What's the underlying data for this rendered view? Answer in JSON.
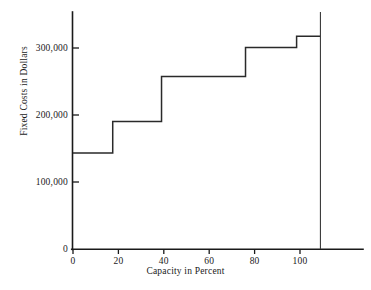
{
  "chart_data": {
    "type": "line",
    "subtype": "step",
    "title": "",
    "xlabel": "Capacity in Percent",
    "ylabel": "Fixed Costs in Dollars",
    "xlim": [
      0,
      115
    ],
    "ylim": [
      0,
      355000
    ],
    "grid": false,
    "legend": null,
    "x_ticks": [
      0,
      20,
      40,
      60,
      80,
      100
    ],
    "x_tick_labels": [
      "0",
      "20",
      "40",
      "60",
      "80",
      "100"
    ],
    "y_ticks": [
      0,
      100000,
      200000,
      300000
    ],
    "y_tick_labels": [
      "0",
      "100,000",
      "200,000",
      "300,000"
    ],
    "series": [
      {
        "name": "Fixed Costs",
        "step_points": [
          {
            "x_start": 0,
            "x_end": 17.5,
            "y": 143000
          },
          {
            "x_start": 17.5,
            "x_end": 39,
            "y": 190000
          },
          {
            "x_start": 39,
            "x_end": 76,
            "y": 257000
          },
          {
            "x_start": 76,
            "x_end": 98.5,
            "y": 300000
          },
          {
            "x_start": 98.5,
            "x_end": 109,
            "y": 317000
          }
        ]
      }
    ],
    "annotations": [
      {
        "name": "capacity-limit-line",
        "x": 109,
        "description": "vertical line at full capacity"
      }
    ],
    "colors": {
      "axis": "#1a1a1a",
      "step_line": "#2a2a2a",
      "background": "#ffffff"
    }
  }
}
